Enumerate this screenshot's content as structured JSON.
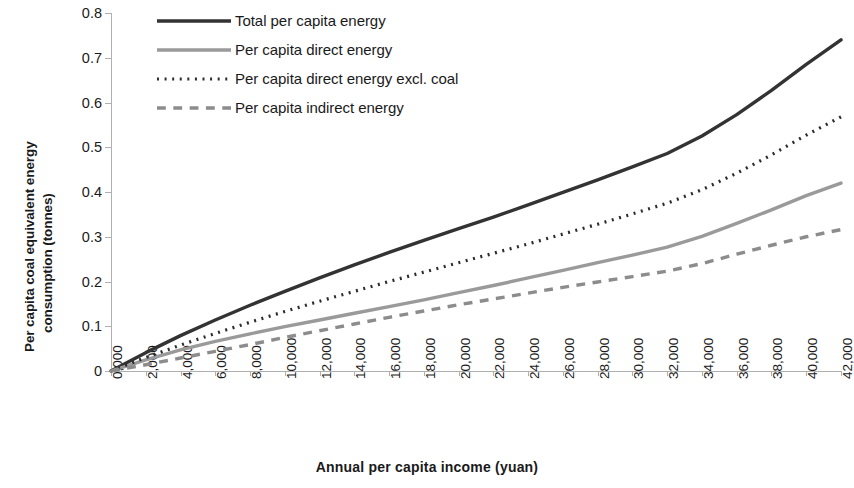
{
  "chart_data": {
    "type": "line",
    "title": "",
    "xlabel": "Annual per capita income (yuan)",
    "ylabel": "Per capita coal equivalent energy consumption (tonnes)",
    "ylabel_line1": "Per capita coal equivalent energy",
    "ylabel_line2": "consumption (tonnes)",
    "xlim": [
      0,
      42000
    ],
    "ylim": [
      0,
      0.8
    ],
    "grid": false,
    "legend_position": "top-left inside plot",
    "x_tick_labels": [
      "0,000",
      "2,000",
      "4,000",
      "6,000",
      "8,000",
      "10,000",
      "12,000",
      "14,000",
      "16,000",
      "18,000",
      "20,000",
      "22,000",
      "24,000",
      "26,000",
      "28,000",
      "30,000",
      "32,000",
      "34,000",
      "36,000",
      "38,000",
      "40,000",
      "42,000"
    ],
    "y_tick_labels": [
      "0",
      "0.1",
      "0.2",
      "0.3",
      "0.4",
      "0.5",
      "0.6",
      "0.7",
      "0.8"
    ],
    "x": [
      0,
      2000,
      4000,
      6000,
      8000,
      10000,
      12000,
      14000,
      16000,
      18000,
      20000,
      22000,
      24000,
      26000,
      28000,
      30000,
      32000,
      34000,
      36000,
      38000,
      40000,
      42000
    ],
    "series": [
      {
        "name": "Total per capita energy",
        "style": "solid",
        "color": "#333333",
        "width": 3.4,
        "values": [
          0.0,
          0.041,
          0.079,
          0.114,
          0.147,
          0.178,
          0.208,
          0.237,
          0.265,
          0.292,
          0.318,
          0.344,
          0.371,
          0.399,
          0.427,
          0.456,
          0.486,
          0.525,
          0.573,
          0.627,
          0.685,
          0.74
        ]
      },
      {
        "name": "Per capita direct energy",
        "style": "solid",
        "color": "#9a9a9a",
        "width": 3.4,
        "values": [
          0.0,
          0.025,
          0.047,
          0.066,
          0.083,
          0.099,
          0.114,
          0.129,
          0.144,
          0.159,
          0.175,
          0.191,
          0.208,
          0.225,
          0.242,
          0.259,
          0.277,
          0.301,
          0.33,
          0.36,
          0.392,
          0.42
        ]
      },
      {
        "name": "Per capita direct energy excl. coal",
        "style": "dotted",
        "color": "#2b2b2b",
        "width": 3.2,
        "values": [
          0.0,
          0.03,
          0.058,
          0.084,
          0.109,
          0.133,
          0.156,
          0.178,
          0.2,
          0.221,
          0.242,
          0.263,
          0.284,
          0.306,
          0.328,
          0.351,
          0.375,
          0.405,
          0.442,
          0.483,
          0.527,
          0.568
        ]
      },
      {
        "name": "Per capita indirect energy",
        "style": "dashed",
        "color": "#8c8c8c",
        "width": 3.4,
        "values": [
          0.0,
          0.014,
          0.029,
          0.044,
          0.059,
          0.075,
          0.09,
          0.105,
          0.12,
          0.134,
          0.148,
          0.161,
          0.174,
          0.187,
          0.199,
          0.211,
          0.223,
          0.24,
          0.261,
          0.281,
          0.3,
          0.316
        ]
      }
    ]
  }
}
